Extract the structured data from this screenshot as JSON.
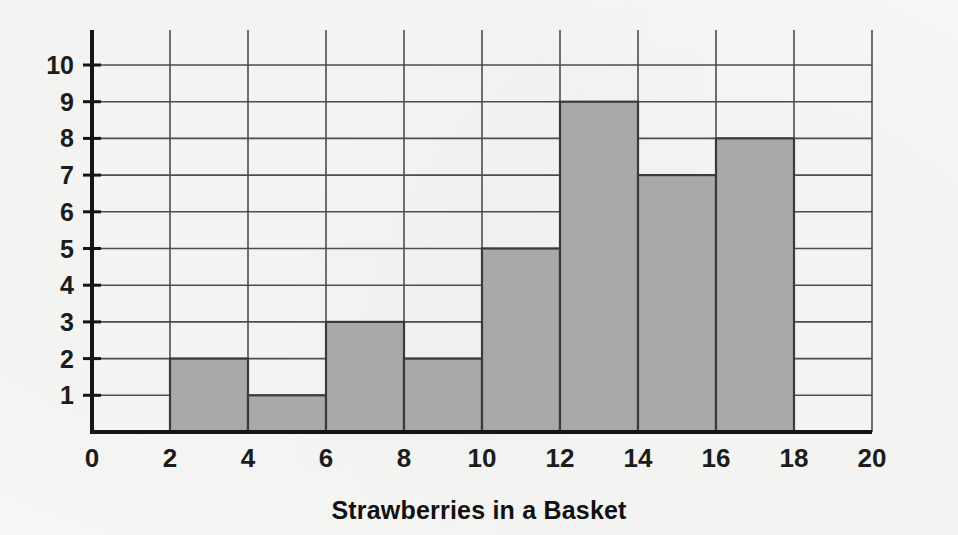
{
  "chart_data": {
    "type": "bar",
    "title": "",
    "xlabel": "Strawberries in a Basket",
    "ylabel": "",
    "xlim": [
      0,
      20
    ],
    "ylim": [
      0,
      10
    ],
    "grid": true,
    "legend": null,
    "bin_width": 2,
    "x_tick_labels": [
      "0",
      "2",
      "4",
      "6",
      "8",
      "10",
      "12",
      "14",
      "16",
      "18",
      "20"
    ],
    "x_ticks": [
      0,
      2,
      4,
      6,
      8,
      10,
      12,
      14,
      16,
      18,
      20
    ],
    "y_tick_labels": [
      "1",
      "2",
      "3",
      "4",
      "5",
      "6",
      "7",
      "8",
      "9",
      "10"
    ],
    "y_ticks": [
      1,
      2,
      3,
      4,
      5,
      6,
      7,
      8,
      9,
      10
    ],
    "categories": [
      "0-2",
      "2-4",
      "4-6",
      "6-8",
      "8-10",
      "10-12",
      "12-14",
      "14-16",
      "16-18",
      "18-20"
    ],
    "bin_starts": [
      0,
      2,
      4,
      6,
      8,
      10,
      12,
      14,
      16,
      18
    ],
    "values": [
      0,
      2,
      1,
      3,
      2,
      5,
      9,
      7,
      8,
      0
    ],
    "bar_fill_color": "#a9a9a9",
    "bar_edge_color": "#3a3a3a",
    "grid_color": "#4d4d4d",
    "axis_color": "#151515",
    "background_color": "#f7f7f5"
  },
  "figure": {
    "x_axis_name": "x-axis",
    "y_axis_name": "y-axis",
    "caption": "Strawberries in a Basket"
  }
}
